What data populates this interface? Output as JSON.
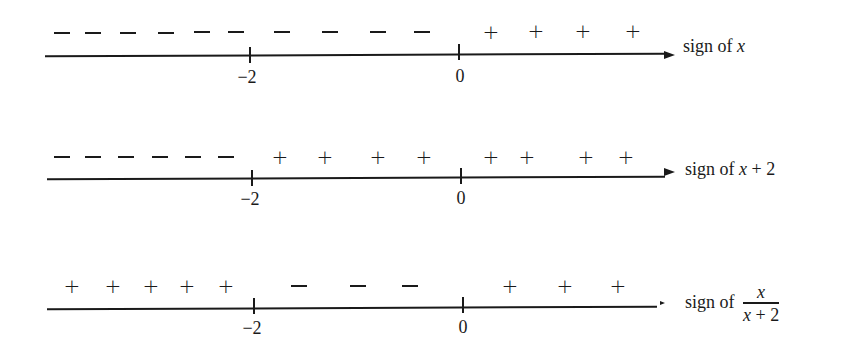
{
  "rows": [
    {
      "caption_prefix": "sign of ",
      "caption_var": "x",
      "caption_suffix": "",
      "tick_labels": [
        "−2",
        "0"
      ],
      "signs": [
        {
          "s": "-",
          "x": 62
        },
        {
          "s": "-",
          "x": 93
        },
        {
          "s": "-",
          "x": 128
        },
        {
          "s": "-",
          "x": 166
        },
        {
          "s": "-",
          "x": 202
        },
        {
          "s": "-",
          "x": 236
        },
        {
          "s": "-",
          "x": 282
        },
        {
          "s": "-",
          "x": 330
        },
        {
          "s": "-",
          "x": 378
        },
        {
          "s": "-",
          "x": 422
        },
        {
          "s": "+",
          "x": 491
        },
        {
          "s": "+",
          "x": 536
        },
        {
          "s": "+",
          "x": 583
        },
        {
          "s": "+",
          "x": 633
        }
      ]
    },
    {
      "caption_prefix": "sign of ",
      "caption_var": "x",
      "caption_suffix": " + 2",
      "tick_labels": [
        "−2",
        "0"
      ],
      "signs": [
        {
          "s": "-",
          "x": 62
        },
        {
          "s": "-",
          "x": 93
        },
        {
          "s": "-",
          "x": 126
        },
        {
          "s": "-",
          "x": 160
        },
        {
          "s": "-",
          "x": 193
        },
        {
          "s": "-",
          "x": 226
        },
        {
          "s": "+",
          "x": 280
        },
        {
          "s": "+",
          "x": 325
        },
        {
          "s": "+",
          "x": 378
        },
        {
          "s": "+",
          "x": 424
        },
        {
          "s": "+",
          "x": 491
        },
        {
          "s": "+",
          "x": 527
        },
        {
          "s": "+",
          "x": 586
        },
        {
          "s": "+",
          "x": 626
        }
      ]
    },
    {
      "caption_prefix": "sign of ",
      "caption_num": "x",
      "caption_den": "x + 2",
      "tick_labels": [
        "−2",
        "0"
      ],
      "signs": [
        {
          "s": "+",
          "x": 72
        },
        {
          "s": "+",
          "x": 113
        },
        {
          "s": "+",
          "x": 151
        },
        {
          "s": "+",
          "x": 187
        },
        {
          "s": "+",
          "x": 226
        },
        {
          "s": "-",
          "x": 299
        },
        {
          "s": "-",
          "x": 358
        },
        {
          "s": "-",
          "x": 410
        },
        {
          "s": "+",
          "x": 510
        },
        {
          "s": "+",
          "x": 565
        },
        {
          "s": "+",
          "x": 618
        }
      ]
    }
  ]
}
